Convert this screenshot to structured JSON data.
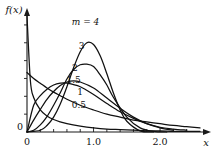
{
  "chart_data": {
    "type": "line",
    "title": "",
    "subtitle": "",
    "xlabel": "x",
    "ylabel": "f(x)",
    "xlim": [
      0,
      2.6
    ],
    "ylim": [
      0,
      1.95
    ],
    "grid": false,
    "legend_position": "inline-curve-labels",
    "x_ticks_major": [
      "0",
      "1.0",
      "2.0"
    ],
    "x_tick_major_values": [
      0,
      1.0,
      2.0
    ],
    "x_tick_minor_values": [
      0.2,
      0.4,
      0.6,
      0.8,
      1.2,
      1.4,
      1.6,
      1.8,
      2.2,
      2.4
    ],
    "y_origin_label": "0",
    "y_tick_values": [
      0.3,
      0.6,
      0.9,
      1.2,
      1.5,
      1.8
    ],
    "y_tick_labels": [],
    "parameter_symbol": "m",
    "distribution": "Weibull probability density",
    "scale_parameter": 1.0,
    "series": [
      {
        "name": "0.5",
        "label": "0.5",
        "m": 0.5,
        "label_x": 0.78,
        "label_y": 0.4,
        "peak_x": 0.0,
        "peak_y": 1.9,
        "values_x": [
          0.0,
          0.05,
          0.1,
          0.2,
          0.3,
          0.4,
          0.5,
          0.6,
          0.8,
          1.0,
          1.2,
          1.4,
          1.6,
          1.8,
          2.0,
          2.2,
          2.4,
          2.6
        ],
        "values_y": [
          1.95,
          0.87,
          0.58,
          0.37,
          0.27,
          0.21,
          0.17,
          0.14,
          0.1,
          0.07,
          0.05,
          0.04,
          0.03,
          0.02,
          0.02,
          0.01,
          0.01,
          0.01
        ]
      },
      {
        "name": "1",
        "label": "1",
        "m": 1.0,
        "label_x": 0.8,
        "label_y": 0.62,
        "peak_x": 0.0,
        "peak_y": 1.0,
        "values_x": [
          0.0,
          0.1,
          0.2,
          0.3,
          0.4,
          0.5,
          0.6,
          0.8,
          1.0,
          1.2,
          1.4,
          1.6,
          1.8,
          2.0,
          2.2,
          2.4,
          2.6
        ],
        "values_y": [
          1.0,
          0.9,
          0.82,
          0.74,
          0.67,
          0.61,
          0.55,
          0.45,
          0.37,
          0.3,
          0.25,
          0.2,
          0.17,
          0.14,
          0.11,
          0.09,
          0.07
        ]
      },
      {
        "name": "1.5",
        "label": "1.5",
        "m": 1.5,
        "label_x": 0.7,
        "label_y": 0.83,
        "peak_x": 0.48,
        "peak_y": 0.83,
        "values_x": [
          0.0,
          0.1,
          0.2,
          0.3,
          0.4,
          0.5,
          0.6,
          0.8,
          1.0,
          1.2,
          1.4,
          1.6,
          1.8,
          2.0,
          2.2,
          2.4
        ],
        "values_y": [
          0.0,
          0.45,
          0.61,
          0.72,
          0.79,
          0.82,
          0.82,
          0.76,
          0.63,
          0.48,
          0.34,
          0.23,
          0.14,
          0.08,
          0.05,
          0.03
        ]
      },
      {
        "name": "2",
        "label": "2",
        "m": 2.0,
        "label_x": 0.72,
        "label_y": 1.02,
        "peak_x": 0.71,
        "peak_y": 0.86,
        "values_x": [
          0.0,
          0.1,
          0.2,
          0.3,
          0.4,
          0.5,
          0.6,
          0.7,
          0.8,
          1.0,
          1.2,
          1.4,
          1.6,
          1.8,
          2.0,
          2.2
        ],
        "values_y": [
          0.0,
          0.2,
          0.38,
          0.55,
          0.68,
          0.78,
          0.84,
          0.86,
          0.84,
          0.74,
          0.57,
          0.4,
          0.25,
          0.14,
          0.07,
          0.03
        ]
      },
      {
        "name": "3",
        "label": "3",
        "m": 3.0,
        "label_x": 0.82,
        "label_y": 1.4,
        "peak_x": 0.87,
        "peak_y": 1.14,
        "values_x": [
          0.0,
          0.1,
          0.2,
          0.3,
          0.4,
          0.5,
          0.6,
          0.7,
          0.8,
          0.9,
          1.0,
          1.1,
          1.2,
          1.3,
          1.5,
          1.7,
          1.9,
          2.1
        ],
        "values_y": [
          0.0,
          0.03,
          0.12,
          0.26,
          0.45,
          0.66,
          0.89,
          1.05,
          1.13,
          1.14,
          1.1,
          0.96,
          0.79,
          0.58,
          0.25,
          0.07,
          0.01,
          0.0
        ]
      },
      {
        "name": "4",
        "label": "m = 4",
        "m": 4.0,
        "label_x": 0.88,
        "label_y": 1.8,
        "peak_x": 0.93,
        "peak_y": 1.52,
        "values_x": [
          0.0,
          0.2,
          0.3,
          0.4,
          0.5,
          0.6,
          0.7,
          0.8,
          0.9,
          1.0,
          1.1,
          1.2,
          1.3,
          1.4,
          1.5,
          1.7,
          1.9
        ],
        "values_y": [
          0.0,
          0.03,
          0.11,
          0.25,
          0.47,
          0.76,
          1.08,
          1.35,
          1.5,
          1.47,
          1.28,
          0.98,
          0.65,
          0.37,
          0.18,
          0.02,
          0.0
        ]
      }
    ]
  },
  "axes": {
    "x_label": "x",
    "y_label": "f(x)",
    "origin_label": "0",
    "x_tick_labels": [
      "0",
      "1.0",
      "2.0"
    ]
  },
  "colors": {
    "curve": "#111111",
    "axis": "#1a1a1a",
    "background": "#ffffff"
  }
}
